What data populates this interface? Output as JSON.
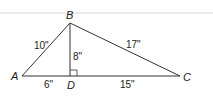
{
  "diagram": {
    "type": "triangle-with-altitude",
    "vertices": {
      "A": {
        "label": "A"
      },
      "B": {
        "label": "B"
      },
      "C": {
        "label": "C"
      },
      "D": {
        "label": "D"
      }
    },
    "segments": {
      "AB": "10\"",
      "BC": "17\"",
      "BD": "8\"",
      "AD": "6\"",
      "DC": "15\""
    },
    "right_angle_at": "D",
    "colors": {
      "line": "#333333",
      "rule": "#ececec"
    }
  }
}
